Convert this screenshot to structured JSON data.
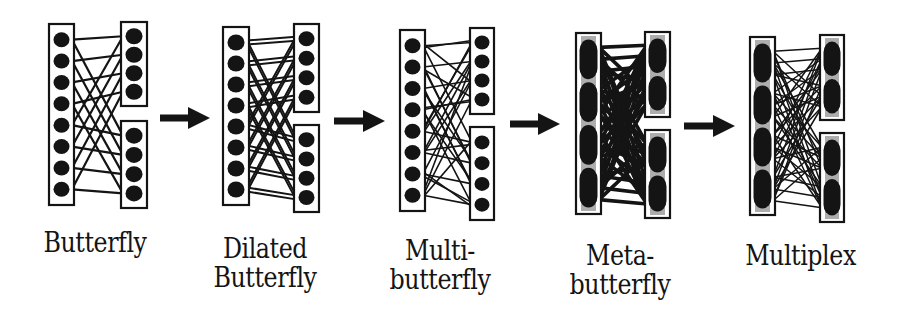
{
  "figure": {
    "colors": {
      "ink": "#141414",
      "background": "#ffffff"
    },
    "stages": [
      {
        "id": "butterfly",
        "label_lines": [
          "Butterfly"
        ],
        "node_style": "dots",
        "left_column": {
          "x": 51,
          "y": 24,
          "w": 21,
          "h": 181,
          "nodes": 8
        },
        "right_blocks": [
          {
            "x": 123,
            "y": 22,
            "w": 22,
            "h": 84,
            "nodes": 4
          },
          {
            "x": 123,
            "y": 121,
            "w": 22,
            "h": 87,
            "nodes": 4
          }
        ],
        "edges_per_node": 2,
        "edge_width": 2.2,
        "label_pos": {
          "x": 10,
          "y": 228,
          "w": 170
        }
      },
      {
        "id": "dilated-butterfly",
        "label_lines": [
          "Dilated",
          "Butterfly"
        ],
        "node_style": "dots",
        "left_column": {
          "x": 225,
          "y": 27,
          "w": 22,
          "h": 178,
          "nodes": 8
        },
        "right_blocks": [
          {
            "x": 296,
            "y": 24,
            "w": 21,
            "h": 88,
            "nodes": 4
          },
          {
            "x": 296,
            "y": 125,
            "w": 21,
            "h": 87,
            "nodes": 4
          }
        ],
        "edges_per_node": 2,
        "dilation": 2,
        "edge_width": 2.0,
        "label_pos": {
          "x": 185,
          "y": 234,
          "w": 160
        }
      },
      {
        "id": "multibutterfly",
        "label_lines": [
          "Multi-",
          "butterfly"
        ],
        "node_style": "dots",
        "left_column": {
          "x": 402,
          "y": 30,
          "w": 21,
          "h": 181,
          "nodes": 8
        },
        "right_blocks": [
          {
            "x": 472,
            "y": 28,
            "w": 20,
            "h": 86,
            "nodes": 4
          },
          {
            "x": 472,
            "y": 127,
            "w": 20,
            "h": 93,
            "nodes": 4
          }
        ],
        "edges_per_node": 4,
        "edge_width": 1.6,
        "label_pos": {
          "x": 355,
          "y": 236,
          "w": 170
        }
      },
      {
        "id": "metabutterfly",
        "label_lines": [
          "Meta-",
          "butterfly"
        ],
        "node_style": "metanodes",
        "left_column": {
          "x": 578,
          "y": 33,
          "w": 21,
          "h": 181,
          "nodes": 4
        },
        "right_blocks": [
          {
            "x": 647,
            "y": 32,
            "w": 21,
            "h": 85,
            "nodes": 2
          },
          {
            "x": 647,
            "y": 130,
            "w": 21,
            "h": 88,
            "nodes": 2
          }
        ],
        "edges_per_node": 6,
        "edge_width": 3.6,
        "label_pos": {
          "x": 540,
          "y": 241,
          "w": 160
        }
      },
      {
        "id": "multiplex",
        "label_lines": [
          "Multiplex"
        ],
        "node_style": "metanodes",
        "left_column": {
          "x": 752,
          "y": 37,
          "w": 21,
          "h": 178,
          "nodes": 4
        },
        "right_blocks": [
          {
            "x": 822,
            "y": 35,
            "w": 20,
            "h": 85,
            "nodes": 2
          },
          {
            "x": 822,
            "y": 133,
            "w": 20,
            "h": 89,
            "nodes": 2
          }
        ],
        "edges_per_node": 6,
        "edge_width": 1.5,
        "label_pos": {
          "x": 718,
          "y": 241,
          "w": 165
        }
      }
    ],
    "arrows": [
      {
        "x1": 160,
        "x2": 210,
        "y": 118
      },
      {
        "x1": 334,
        "x2": 385,
        "y": 121
      },
      {
        "x1": 510,
        "x2": 560,
        "y": 124
      },
      {
        "x1": 684,
        "x2": 735,
        "y": 126
      }
    ]
  }
}
